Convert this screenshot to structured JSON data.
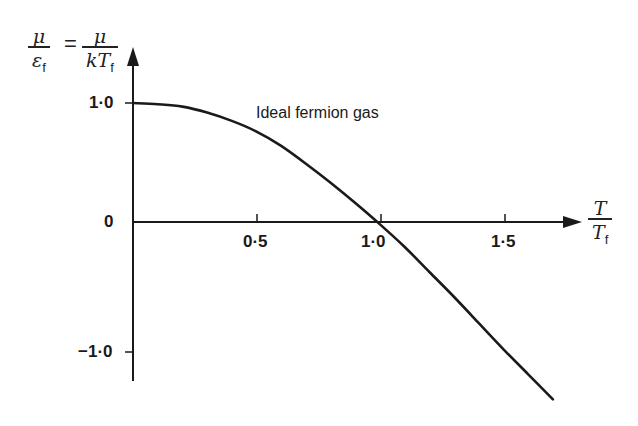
{
  "chart_data": {
    "type": "line",
    "title": "",
    "ylabel": "μ/ε_f = μ/kT_f",
    "xlabel": "T/T_f",
    "ylabel_parts": {
      "left_num": "μ",
      "left_den": "ε",
      "left_den_sub": "f",
      "equals": "=",
      "right_num": "μ",
      "right_den": "kT",
      "right_den_sub": "f"
    },
    "xlabel_parts": {
      "num": "T",
      "den": "T",
      "den_sub": "f"
    },
    "x_ticks": [
      0.5,
      1.0,
      1.5
    ],
    "x_tick_labels": [
      "0·5",
      "1·0",
      "1·5"
    ],
    "y_ticks": [
      1.0,
      0,
      -1.0
    ],
    "y_tick_labels": [
      "1·0",
      "0",
      "−1·0"
    ],
    "xlim": [
      0,
      1.8
    ],
    "ylim": [
      -1.3,
      1.4
    ],
    "grid": false,
    "legend": null,
    "annotations": [
      {
        "text": "Ideal fermion gas",
        "x": 0.95,
        "y": 0.83
      }
    ],
    "series": [
      {
        "name": "Ideal fermion gas",
        "x": [
          0.0,
          0.1,
          0.2,
          0.3,
          0.4,
          0.5,
          0.6,
          0.7,
          0.8,
          0.9,
          1.0,
          1.1,
          1.2,
          1.3,
          1.4,
          1.5,
          1.6,
          1.7
        ],
        "y": [
          1.0,
          0.99,
          0.97,
          0.92,
          0.85,
          0.76,
          0.64,
          0.49,
          0.33,
          0.16,
          -0.02,
          -0.21,
          -0.42,
          -0.63,
          -0.85,
          -1.07,
          -1.28,
          -1.49
        ]
      }
    ]
  }
}
